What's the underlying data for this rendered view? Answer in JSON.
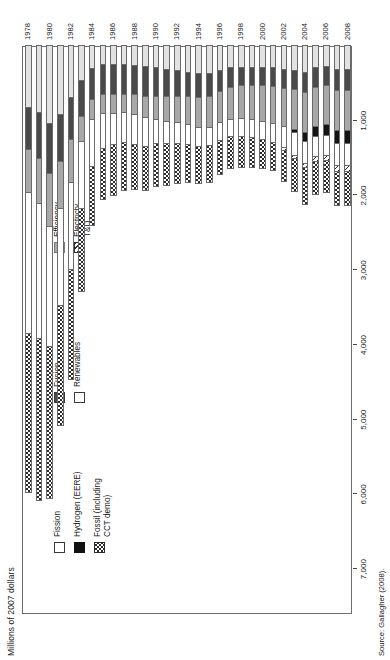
{
  "axis_title": "Millions of 2007 dollars",
  "source_note": "Source: Gallagher (2008).",
  "legend": {
    "columns": [
      [
        {
          "key": "fission",
          "label": "Fission"
        },
        {
          "key": "hydrogen",
          "label": "Hydrogen (EERE)"
        },
        {
          "key": "fossil",
          "label": "Fossil (including\nCCT demo)"
        }
      ],
      [
        {
          "key": "fusion",
          "label": "Fusion"
        },
        {
          "key": "renew",
          "label": "Renewables"
        }
      ],
      [
        {
          "key": "effic",
          "label": "Efficiency"
        },
        {
          "key": "tnd",
          "label": "Electricty T&D"
        }
      ]
    ]
  },
  "chart_data": {
    "type": "bar",
    "orientation": "horizontal-stacked",
    "title": "",
    "xlabel": "",
    "ylabel": "Millions of 2007 dollars",
    "xlim": [
      0,
      7600
    ],
    "ylim": [
      0,
      7600
    ],
    "grid": false,
    "legend_position": "top-left",
    "tick_labels": [
      "7,000",
      "6,000",
      "5,000",
      "4,000",
      "3,000",
      "2,000",
      "1,000"
    ],
    "tick_values": [
      7000,
      6000,
      5000,
      4000,
      3000,
      2000,
      1000
    ],
    "categories": [
      1978,
      1979,
      1980,
      1981,
      1982,
      1983,
      1984,
      1985,
      1986,
      1987,
      1988,
      1989,
      1990,
      1991,
      1992,
      1993,
      1994,
      1995,
      1996,
      1997,
      1998,
      1999,
      2000,
      2001,
      2002,
      2003,
      2004,
      2005,
      2006,
      2007,
      2008
    ],
    "category_tick_labels": [
      "1978",
      "1980",
      "1982",
      "1984",
      "1986",
      "1988",
      "1990",
      "1992",
      "1994",
      "1996",
      "1998",
      "2000",
      "2002",
      "2004",
      "2006",
      "2008"
    ],
    "stack_order": [
      "fossil",
      "tnd",
      "fission",
      "hydrogen",
      "efficiency",
      "fusion",
      "renewables"
    ],
    "series": [
      {
        "name": "Fossil (including CCT demo)",
        "key": "fossil",
        "values": [
          2150,
          2180,
          2050,
          1620,
          1480,
          1120,
          800,
          700,
          690,
          650,
          620,
          600,
          580,
          560,
          540,
          520,
          510,
          500,
          470,
          440,
          420,
          400,
          390,
          380,
          420,
          450,
          500,
          450,
          440,
          470,
          470
        ]
      },
      {
        "name": "Electricty T&D",
        "key": "tnd",
        "values": [
          0,
          0,
          0,
          0,
          0,
          0,
          0,
          0,
          0,
          0,
          0,
          0,
          0,
          0,
          0,
          0,
          0,
          0,
          0,
          0,
          0,
          0,
          0,
          0,
          35,
          40,
          50,
          55,
          60,
          70,
          70
        ]
      },
      {
        "name": "Fission",
        "key": "fission",
        "values": [
          1900,
          1820,
          1620,
          1300,
          1180,
          900,
          640,
          480,
          430,
          400,
          400,
          390,
          330,
          300,
          280,
          260,
          250,
          240,
          230,
          220,
          230,
          240,
          250,
          260,
          280,
          300,
          300,
          270,
          260,
          300,
          300
        ]
      },
      {
        "name": "Hydrogen (EERE)",
        "key": "hydrogen",
        "values": [
          0,
          0,
          0,
          0,
          0,
          0,
          0,
          0,
          0,
          0,
          0,
          0,
          0,
          0,
          0,
          0,
          0,
          0,
          0,
          0,
          0,
          0,
          0,
          0,
          0,
          40,
          110,
          130,
          150,
          160,
          160
        ]
      },
      {
        "name": "Efficiency",
        "key": "efficiency",
        "values": [
          560,
          600,
          700,
          630,
          560,
          340,
          260,
          250,
          250,
          250,
          260,
          280,
          300,
          330,
          350,
          380,
          400,
          420,
          420,
          440,
          450,
          460,
          480,
          500,
          520,
          540,
          550,
          540,
          530,
          560,
          560
        ]
      },
      {
        "name": "Fusion",
        "key": "fusion",
        "values": [
          560,
          600,
          660,
          620,
          560,
          480,
          420,
          400,
          400,
          400,
          400,
          400,
          390,
          370,
          350,
          330,
          320,
          300,
          280,
          260,
          250,
          250,
          250,
          250,
          260,
          260,
          270,
          260,
          260,
          270,
          270
        ]
      },
      {
        "name": "Renewables",
        "key": "renewables",
        "values": [
          830,
          900,
          1050,
          930,
          700,
          460,
          300,
          250,
          250,
          250,
          260,
          280,
          300,
          320,
          340,
          360,
          380,
          380,
          340,
          300,
          290,
          290,
          290,
          300,
          320,
          340,
          360,
          300,
          280,
          330,
          330
        ]
      }
    ]
  }
}
